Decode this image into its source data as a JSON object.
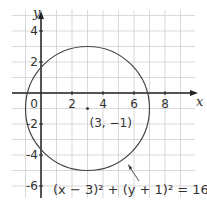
{
  "chart_data": {
    "type": "line",
    "title": "",
    "xlabel": "x",
    "ylabel": "y",
    "xlim": [
      -1.9,
      10
    ],
    "ylim": [
      -6.8,
      5.3
    ],
    "grid": true,
    "x_ticks": [
      {
        "value": 0,
        "label": "0"
      },
      {
        "value": 2,
        "label": "2"
      },
      {
        "value": 4,
        "label": "4"
      },
      {
        "value": 6,
        "label": "6"
      },
      {
        "value": 8,
        "label": "8"
      }
    ],
    "y_ticks": [
      {
        "value": 4,
        "label": "4"
      },
      {
        "value": 2,
        "label": "2"
      },
      {
        "value": -2,
        "label": "-2"
      },
      {
        "value": -4,
        "label": "-4"
      },
      {
        "value": -6,
        "label": "-6"
      }
    ],
    "series": [
      {
        "name": "circle",
        "shape": "circle",
        "center": [
          3,
          -1
        ],
        "radius": 4,
        "equation": "(x − 3)² + (y + 1)² = 16"
      }
    ],
    "annotations": [
      {
        "type": "point",
        "x": 3,
        "y": -1,
        "label": "(3, −1)"
      },
      {
        "type": "arrow_label",
        "text": "(x − 3)² + (y + 1)² = 16",
        "points_to": [
          5.6,
          -4.0
        ]
      }
    ]
  },
  "labels": {
    "x_axis": "x",
    "y_axis": "y",
    "center_point": "(3, −1)",
    "equation": "(x − 3)² + (y + 1)² = 16",
    "tick_x_0": "0",
    "tick_x_2": "2",
    "tick_x_4": "4",
    "tick_x_6": "6",
    "tick_x_8": "8",
    "tick_y_4": "4",
    "tick_y_2": "2",
    "tick_y_m2": "-2",
    "tick_y_m4": "-4",
    "tick_y_m6": "-6"
  },
  "colors": {
    "grid": "#cfcfcf",
    "axis": "#222222",
    "curve": "#444444",
    "text": "#333333"
  }
}
